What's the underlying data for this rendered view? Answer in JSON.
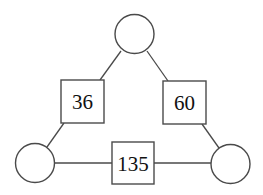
{
  "diagram": {
    "type": "number-triangle",
    "circles": [
      {
        "id": "top",
        "label": "",
        "cx": 134.5,
        "cy": 34,
        "r": 19.5
      },
      {
        "id": "bottom-left",
        "label": "",
        "cx": 35,
        "cy": 163,
        "r": 19.5
      },
      {
        "id": "bottom-right",
        "label": "",
        "cx": 230.5,
        "cy": 164,
        "r": 19.5
      }
    ],
    "boxes": [
      {
        "id": "left",
        "label": "36",
        "x": 61,
        "y": 80,
        "w": 43,
        "h": 43
      },
      {
        "id": "right",
        "label": "60",
        "x": 163,
        "y": 81,
        "w": 43,
        "h": 43
      },
      {
        "id": "bottom",
        "label": "135",
        "x": 112,
        "y": 142,
        "w": 42,
        "h": 42
      }
    ],
    "edges": [
      {
        "from": "top",
        "to": "left"
      },
      {
        "from": "left",
        "to": "bottom-left"
      },
      {
        "from": "top",
        "to": "right"
      },
      {
        "from": "right",
        "to": "bottom-right"
      },
      {
        "from": "bottom-left",
        "to": "bottom"
      },
      {
        "from": "bottom",
        "to": "bottom-right"
      }
    ]
  }
}
